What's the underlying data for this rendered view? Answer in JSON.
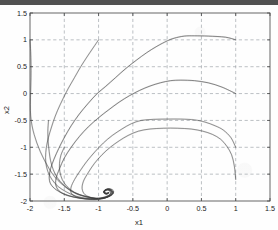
{
  "chart_data": {
    "type": "line",
    "title": "",
    "subtitle": "",
    "xlabel": "x1",
    "ylabel": "x2",
    "xlim": [
      -2,
      1.5
    ],
    "ylim": [
      -2,
      1.5
    ],
    "xticks": [
      -2,
      -1.5,
      -1,
      -0.5,
      0,
      0.5,
      1,
      1.5
    ],
    "xticklabels": [
      "-2",
      "-1.5",
      "-1",
      "-0.5",
      "0",
      "0.5",
      "1",
      "1.5"
    ],
    "yticks": [
      -2,
      -1.5,
      -1,
      -0.5,
      0,
      0.5,
      1,
      1.5
    ],
    "yticklabels": [
      "-2",
      "-1.5",
      "-1",
      "-0.5",
      "0",
      "0.5",
      "1",
      "1.5"
    ],
    "grid": true,
    "grid_style": "dashed",
    "grid_color": "#9aa0a6",
    "legend": false,
    "legend_position": "none",
    "line_color": "#3a3a3a",
    "background_color": "#fefefe",
    "axis_color": "#4d4d4d",
    "equilibrium_point": [
      -0.85,
      -1.85
    ],
    "series": [
      {
        "name": "trajectory-1",
        "points": [
          [
            1.0,
            1.0
          ],
          [
            0.85,
            1.05
          ],
          [
            0.6,
            1.07
          ],
          [
            0.4,
            1.075
          ],
          [
            0.25,
            1.07
          ],
          [
            0.1,
            1.03
          ],
          [
            0.0,
            0.98
          ],
          [
            -0.15,
            0.88
          ],
          [
            -0.3,
            0.76
          ],
          [
            -0.45,
            0.62
          ],
          [
            -0.6,
            0.47
          ],
          [
            -0.75,
            0.3
          ],
          [
            -0.9,
            0.13
          ],
          [
            -1.02,
            0.0
          ],
          [
            -1.15,
            -0.18
          ],
          [
            -1.28,
            -0.38
          ],
          [
            -1.4,
            -0.6
          ],
          [
            -1.5,
            -0.82
          ],
          [
            -1.58,
            -1.02
          ],
          [
            -1.65,
            -1.22
          ],
          [
            -1.7,
            -1.4
          ],
          [
            -1.72,
            -1.55
          ],
          [
            -1.7,
            -1.68
          ],
          [
            -1.62,
            -1.79
          ],
          [
            -1.5,
            -1.87
          ],
          [
            -1.35,
            -1.93
          ],
          [
            -1.2,
            -1.96
          ],
          [
            -1.05,
            -1.97
          ],
          [
            -0.95,
            -1.95
          ],
          [
            -0.86,
            -1.92
          ],
          [
            -0.8,
            -1.88
          ],
          [
            -0.78,
            -1.83
          ],
          [
            -0.8,
            -1.79
          ],
          [
            -0.85,
            -1.77
          ],
          [
            -0.9,
            -1.79
          ],
          [
            -0.92,
            -1.83
          ],
          [
            -0.89,
            -1.86
          ],
          [
            -0.86,
            -1.85
          ]
        ]
      },
      {
        "name": "trajectory-2",
        "points": [
          [
            1.0,
            0.0
          ],
          [
            0.8,
            0.12
          ],
          [
            0.6,
            0.2
          ],
          [
            0.4,
            0.24
          ],
          [
            0.2,
            0.25
          ],
          [
            0.05,
            0.24
          ],
          [
            -0.1,
            0.2
          ],
          [
            -0.25,
            0.14
          ],
          [
            -0.4,
            0.06
          ],
          [
            -0.55,
            -0.04
          ],
          [
            -0.7,
            -0.16
          ],
          [
            -0.85,
            -0.3
          ],
          [
            -1.0,
            -0.45
          ],
          [
            -1.15,
            -0.62
          ],
          [
            -1.28,
            -0.8
          ],
          [
            -1.4,
            -1.0
          ],
          [
            -1.5,
            -1.2
          ],
          [
            -1.57,
            -1.4
          ],
          [
            -1.62,
            -1.58
          ],
          [
            -1.62,
            -1.72
          ],
          [
            -1.56,
            -1.83
          ],
          [
            -1.45,
            -1.9
          ],
          [
            -1.3,
            -1.94
          ],
          [
            -1.15,
            -1.96
          ],
          [
            -1.0,
            -1.95
          ],
          [
            -0.9,
            -1.92
          ],
          [
            -0.83,
            -1.88
          ],
          [
            -0.81,
            -1.83
          ],
          [
            -0.84,
            -1.79
          ],
          [
            -0.89,
            -1.79
          ],
          [
            -0.91,
            -1.83
          ],
          [
            -0.88,
            -1.86
          ],
          [
            -0.86,
            -1.85
          ]
        ]
      },
      {
        "name": "trajectory-3",
        "points": [
          [
            1.0,
            -1.0
          ],
          [
            0.93,
            -0.82
          ],
          [
            0.82,
            -0.68
          ],
          [
            0.7,
            -0.6
          ],
          [
            0.55,
            -0.53
          ],
          [
            0.4,
            -0.49
          ],
          [
            0.2,
            -0.475
          ],
          [
            0.0,
            -0.475
          ],
          [
            -0.2,
            -0.48
          ],
          [
            -0.38,
            -0.5
          ],
          [
            -0.52,
            -0.56
          ],
          [
            -0.66,
            -0.66
          ],
          [
            -0.8,
            -0.78
          ],
          [
            -0.93,
            -0.92
          ],
          [
            -1.05,
            -1.08
          ],
          [
            -1.17,
            -1.26
          ],
          [
            -1.27,
            -1.44
          ],
          [
            -1.35,
            -1.6
          ],
          [
            -1.4,
            -1.74
          ],
          [
            -1.4,
            -1.85
          ],
          [
            -1.33,
            -1.92
          ],
          [
            -1.2,
            -1.96
          ],
          [
            -1.05,
            -1.97
          ],
          [
            -0.95,
            -1.95
          ],
          [
            -0.87,
            -1.91
          ],
          [
            -0.82,
            -1.86
          ],
          [
            -0.83,
            -1.81
          ],
          [
            -0.88,
            -1.79
          ],
          [
            -0.92,
            -1.82
          ],
          [
            -0.9,
            -1.86
          ],
          [
            -0.86,
            -1.85
          ]
        ]
      },
      {
        "name": "trajectory-4",
        "points": [
          [
            1.0,
            -1.6
          ],
          [
            0.98,
            -1.35
          ],
          [
            0.94,
            -1.14
          ],
          [
            0.87,
            -0.98
          ],
          [
            0.78,
            -0.85
          ],
          [
            0.66,
            -0.76
          ],
          [
            0.52,
            -0.7
          ],
          [
            0.35,
            -0.66
          ],
          [
            0.15,
            -0.645
          ],
          [
            -0.05,
            -0.645
          ],
          [
            -0.25,
            -0.66
          ],
          [
            -0.42,
            -0.7
          ],
          [
            -0.57,
            -0.78
          ],
          [
            -0.7,
            -0.88
          ],
          [
            -0.83,
            -1.0
          ],
          [
            -0.95,
            -1.14
          ],
          [
            -1.06,
            -1.3
          ],
          [
            -1.15,
            -1.47
          ],
          [
            -1.22,
            -1.63
          ],
          [
            -1.24,
            -1.77
          ],
          [
            -1.2,
            -1.88
          ],
          [
            -1.1,
            -1.94
          ],
          [
            -0.99,
            -1.96
          ],
          [
            -0.9,
            -1.94
          ],
          [
            -0.84,
            -1.89
          ],
          [
            -0.83,
            -1.83
          ],
          [
            -0.87,
            -1.79
          ],
          [
            -0.92,
            -1.82
          ],
          [
            -0.9,
            -1.86
          ],
          [
            -0.86,
            -1.85
          ]
        ]
      },
      {
        "name": "trajectory-5",
        "points": [
          [
            -2.0,
            1.0
          ],
          [
            -1.99,
            0.78
          ],
          [
            -1.985,
            0.55
          ],
          [
            -1.985,
            0.3
          ],
          [
            -1.99,
            0.05
          ],
          [
            -1.995,
            -0.2
          ],
          [
            -1.99,
            -0.42
          ],
          [
            -1.97,
            -0.6
          ],
          [
            -1.94,
            -0.76
          ],
          [
            -1.9,
            -0.92
          ],
          [
            -1.85,
            -1.08
          ],
          [
            -1.79,
            -1.24
          ],
          [
            -1.72,
            -1.4
          ],
          [
            -1.64,
            -1.55
          ],
          [
            -1.54,
            -1.68
          ],
          [
            -1.43,
            -1.79
          ],
          [
            -1.3,
            -1.88
          ],
          [
            -1.15,
            -1.93
          ],
          [
            -1.0,
            -1.955
          ],
          [
            -0.9,
            -1.94
          ],
          [
            -0.83,
            -1.9
          ],
          [
            -0.79,
            -1.85
          ],
          [
            -0.81,
            -1.8
          ],
          [
            -0.86,
            -1.78
          ],
          [
            -0.91,
            -1.81
          ],
          [
            -0.91,
            -1.855
          ],
          [
            -0.87,
            -1.865
          ],
          [
            -0.855,
            -1.845
          ]
        ]
      },
      {
        "name": "trajectory-6",
        "points": [
          [
            -1.0,
            1.0
          ],
          [
            -1.08,
            0.85
          ],
          [
            -1.17,
            0.68
          ],
          [
            -1.26,
            0.5
          ],
          [
            -1.35,
            0.3
          ],
          [
            -1.44,
            0.1
          ],
          [
            -1.52,
            -0.1
          ],
          [
            -1.6,
            -0.32
          ],
          [
            -1.66,
            -0.52
          ],
          [
            -1.71,
            -0.72
          ],
          [
            -1.75,
            -0.92
          ],
          [
            -1.77,
            -1.1
          ],
          [
            -1.77,
            -1.28
          ],
          [
            -1.74,
            -1.45
          ],
          [
            -1.68,
            -1.6
          ],
          [
            -1.59,
            -1.73
          ],
          [
            -1.47,
            -1.83
          ],
          [
            -1.33,
            -1.91
          ],
          [
            -1.17,
            -1.95
          ],
          [
            -1.02,
            -1.965
          ],
          [
            -0.92,
            -1.95
          ],
          [
            -0.84,
            -1.91
          ],
          [
            -0.79,
            -1.86
          ],
          [
            -0.8,
            -1.81
          ],
          [
            -0.85,
            -1.775
          ],
          [
            -0.91,
            -1.8
          ],
          [
            -0.925,
            -1.845
          ],
          [
            -0.885,
            -1.87
          ],
          [
            -0.855,
            -1.85
          ]
        ]
      },
      {
        "name": "trajectory-7",
        "points": [
          [
            -1.73,
            -0.5
          ],
          [
            -1.74,
            -0.7
          ],
          [
            -1.735,
            -0.9
          ],
          [
            -1.72,
            -1.08
          ],
          [
            -1.7,
            -1.25
          ],
          [
            -1.66,
            -1.42
          ],
          [
            -1.6,
            -1.57
          ],
          [
            -1.51,
            -1.7
          ],
          [
            -1.4,
            -1.81
          ],
          [
            -1.26,
            -1.89
          ],
          [
            -1.1,
            -1.94
          ],
          [
            -0.97,
            -1.955
          ],
          [
            -0.88,
            -1.93
          ],
          [
            -0.82,
            -1.89
          ],
          [
            -0.8,
            -1.84
          ],
          [
            -0.84,
            -1.795
          ],
          [
            -0.9,
            -1.8
          ],
          [
            -0.92,
            -1.845
          ],
          [
            -0.885,
            -1.87
          ],
          [
            -0.86,
            -1.85
          ]
        ]
      },
      {
        "name": "trajectory-8",
        "points": [
          [
            -1.5,
            -1.0
          ],
          [
            -1.55,
            -1.15
          ],
          [
            -1.57,
            -1.3
          ],
          [
            -1.565,
            -1.45
          ],
          [
            -1.53,
            -1.6
          ],
          [
            -1.46,
            -1.73
          ],
          [
            -1.35,
            -1.84
          ],
          [
            -1.2,
            -1.91
          ],
          [
            -1.05,
            -1.95
          ],
          [
            -0.93,
            -1.94
          ],
          [
            -0.85,
            -1.91
          ],
          [
            -0.8,
            -1.86
          ],
          [
            -0.81,
            -1.81
          ],
          [
            -0.87,
            -1.785
          ],
          [
            -0.92,
            -1.82
          ],
          [
            -0.91,
            -1.86
          ],
          [
            -0.87,
            -1.862
          ],
          [
            -0.858,
            -1.848
          ]
        ]
      }
    ]
  }
}
